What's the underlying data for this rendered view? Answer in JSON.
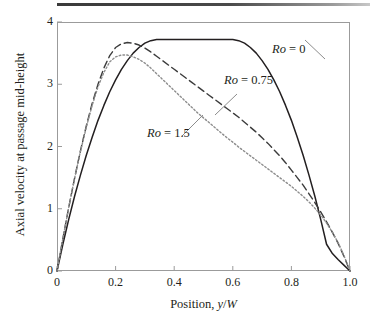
{
  "figure": {
    "top_rule": true
  },
  "axes": {
    "x": {
      "label_prefix": "Position, ",
      "label_var1": "y",
      "label_sep": "/",
      "label_var2": "W",
      "ticks": [
        "0",
        "0.2",
        "0.4",
        "0.6",
        "0.8",
        "1.0"
      ],
      "tick_values": [
        0,
        0.2,
        0.4,
        0.6,
        0.8,
        1.0
      ],
      "min": 0,
      "max": 1.0
    },
    "y": {
      "label": "Axial velocity at passage mid-height",
      "ticks": [
        "0",
        "1",
        "2",
        "3",
        "4"
      ],
      "tick_values": [
        0,
        1,
        2,
        3,
        4
      ],
      "min": 0,
      "max": 4
    }
  },
  "annotations": [
    {
      "id": "ro0",
      "prefix": "Ro",
      "eq": " = ",
      "value": "0"
    },
    {
      "id": "ro075",
      "prefix": "Ro",
      "eq": " = ",
      "value": "0.75"
    },
    {
      "id": "ro15",
      "prefix": "Ro",
      "eq": " = ",
      "value": "1.5"
    }
  ],
  "colors": {
    "line_solid": "#231f20",
    "line_dashed": "#3b3b3b",
    "line_dotted": "#8d8d8d",
    "frame": "#9b9b9b",
    "text": "#231f20",
    "top_rule": "#3a3a3a"
  },
  "chart_data": {
    "type": "line",
    "title": "",
    "xlabel": "Position, y/W",
    "ylabel": "Axial velocity at passage mid-height",
    "xlim": [
      0,
      1.0
    ],
    "ylim": [
      0,
      4
    ],
    "xticks": [
      0,
      0.2,
      0.4,
      0.6,
      0.8,
      1.0
    ],
    "yticks": [
      0,
      1,
      2,
      3,
      4
    ],
    "grid": false,
    "legend": "inline-annotations",
    "x": [
      0.0,
      0.02,
      0.04,
      0.06,
      0.08,
      0.1,
      0.12,
      0.14,
      0.16,
      0.18,
      0.2,
      0.22,
      0.24,
      0.26,
      0.28,
      0.3,
      0.32,
      0.34,
      0.36,
      0.38,
      0.4,
      0.42,
      0.44,
      0.46,
      0.48,
      0.5,
      0.52,
      0.54,
      0.56,
      0.58,
      0.6,
      0.62,
      0.64,
      0.66,
      0.68,
      0.7,
      0.72,
      0.74,
      0.76,
      0.78,
      0.8,
      0.82,
      0.84,
      0.86,
      0.88,
      0.9,
      0.92,
      0.94,
      0.96,
      0.98,
      1.0
    ],
    "series": [
      {
        "name": "Ro = 0",
        "style": "solid",
        "peak_x": 0.5,
        "peak_y": 3.72,
        "values": [
          0.0,
          0.43,
          0.83,
          1.2,
          1.54,
          1.86,
          2.15,
          2.42,
          2.66,
          2.88,
          3.07,
          3.24,
          3.38,
          3.5,
          3.59,
          3.66,
          3.7,
          3.72,
          3.72,
          3.72,
          3.72,
          3.72,
          3.72,
          3.72,
          3.72,
          3.72,
          3.72,
          3.72,
          3.72,
          3.72,
          3.72,
          3.7,
          3.66,
          3.59,
          3.5,
          3.38,
          3.24,
          3.07,
          2.88,
          2.66,
          2.42,
          2.15,
          1.86,
          1.54,
          1.2,
          0.83,
          0.43,
          0.28,
          0.18,
          0.09,
          0.0
        ]
      },
      {
        "name": "Ro = 0.75",
        "style": "dashed",
        "peak_x": 0.24,
        "peak_y": 3.67,
        "values": [
          0.0,
          0.52,
          1.02,
          1.49,
          1.93,
          2.33,
          2.69,
          3.0,
          3.26,
          3.46,
          3.59,
          3.65,
          3.67,
          3.66,
          3.63,
          3.58,
          3.52,
          3.45,
          3.38,
          3.31,
          3.24,
          3.17,
          3.1,
          3.03,
          2.96,
          2.89,
          2.82,
          2.75,
          2.68,
          2.61,
          2.54,
          2.47,
          2.39,
          2.31,
          2.23,
          2.14,
          2.05,
          1.95,
          1.85,
          1.74,
          1.62,
          1.5,
          1.38,
          1.24,
          1.1,
          0.95,
          0.79,
          0.62,
          0.44,
          0.23,
          0.0
        ]
      },
      {
        "name": "Ro = 1.5",
        "style": "dotted",
        "peak_x": 0.23,
        "peak_y": 3.47,
        "values": [
          0.0,
          0.52,
          1.02,
          1.49,
          1.92,
          2.31,
          2.66,
          2.96,
          3.19,
          3.36,
          3.44,
          3.47,
          3.47,
          3.44,
          3.4,
          3.34,
          3.26,
          3.17,
          3.08,
          2.99,
          2.9,
          2.81,
          2.72,
          2.63,
          2.54,
          2.46,
          2.38,
          2.3,
          2.22,
          2.14,
          2.07,
          1.99,
          1.92,
          1.85,
          1.78,
          1.71,
          1.64,
          1.57,
          1.5,
          1.43,
          1.36,
          1.28,
          1.2,
          1.11,
          1.01,
          0.9,
          0.77,
          0.62,
          0.45,
          0.24,
          0.0
        ]
      }
    ]
  }
}
